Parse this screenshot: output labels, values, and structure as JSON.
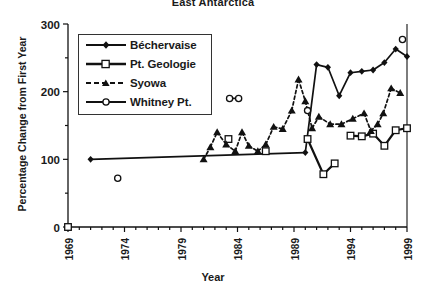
{
  "chart_data": {
    "type": "line",
    "title": "East Antarctica",
    "xlabel": "Year",
    "ylabel": "Percentage Change from First Year",
    "xlim": [
      1969,
      1999
    ],
    "ylim": [
      0,
      300
    ],
    "xticks": [
      1969,
      1974,
      1979,
      1984,
      1989,
      1994,
      1999
    ],
    "yticks": [
      0,
      100,
      200,
      300
    ],
    "xminor_step": 1,
    "yminor_step": 50,
    "grid": false,
    "legend_position": "upper-left",
    "series": [
      {
        "name": "Béchervaise",
        "marker": "filled-diamond",
        "line": "solid",
        "points": [
          {
            "x": 1971.0,
            "y": 100,
            "connected": false
          },
          {
            "x": 1990.0,
            "y": 110
          },
          {
            "x": 1991.0,
            "y": 240
          },
          {
            "x": 1992.0,
            "y": 236
          },
          {
            "x": 1993.0,
            "y": 194
          },
          {
            "x": 1994.0,
            "y": 228
          },
          {
            "x": 1995.0,
            "y": 230
          },
          {
            "x": 1996.0,
            "y": 232
          },
          {
            "x": 1997.0,
            "y": 243
          },
          {
            "x": 1998.0,
            "y": 263
          },
          {
            "x": 1999.0,
            "y": 252
          }
        ]
      },
      {
        "name": "Pt.  Geologie",
        "marker": "open-square",
        "line": "solid",
        "points": [
          {
            "x": 1969.0,
            "y": 0,
            "connected": false
          },
          {
            "x": 1983.2,
            "y": 130,
            "connected": false
          },
          {
            "x": 1986.5,
            "y": 112,
            "connected": false
          },
          {
            "x": 1990.2,
            "y": 130,
            "connected": false
          },
          {
            "x": 1991.6,
            "y": 78
          },
          {
            "x": 1992.6,
            "y": 94
          },
          {
            "x": 1994.0,
            "y": 135,
            "connected": false
          },
          {
            "x": 1995.0,
            "y": 134
          },
          {
            "x": 1996.0,
            "y": 138
          },
          {
            "x": 1997.0,
            "y": 120
          },
          {
            "x": 1998.0,
            "y": 143
          },
          {
            "x": 1999.0,
            "y": 146
          }
        ]
      },
      {
        "name": "Syowa",
        "marker": "filled-triangle",
        "line": "dashed",
        "points": [
          {
            "x": 1981.0,
            "y": 100
          },
          {
            "x": 1981.6,
            "y": 118
          },
          {
            "x": 1982.2,
            "y": 140
          },
          {
            "x": 1983.0,
            "y": 122
          },
          {
            "x": 1983.8,
            "y": 112
          },
          {
            "x": 1984.4,
            "y": 140
          },
          {
            "x": 1985.0,
            "y": 120
          },
          {
            "x": 1985.8,
            "y": 112
          },
          {
            "x": 1986.5,
            "y": 122
          },
          {
            "x": 1987.2,
            "y": 148
          },
          {
            "x": 1988.0,
            "y": 145
          },
          {
            "x": 1988.8,
            "y": 172
          },
          {
            "x": 1989.4,
            "y": 218
          },
          {
            "x": 1990.0,
            "y": 186
          },
          {
            "x": 1990.6,
            "y": 146
          },
          {
            "x": 1991.2,
            "y": 163
          },
          {
            "x": 1992.2,
            "y": 152
          },
          {
            "x": 1993.2,
            "y": 152
          },
          {
            "x": 1994.2,
            "y": 160
          },
          {
            "x": 1995.2,
            "y": 168
          },
          {
            "x": 1995.8,
            "y": 142
          },
          {
            "x": 1996.4,
            "y": 152
          },
          {
            "x": 1996.9,
            "y": 168
          },
          {
            "x": 1997.6,
            "y": 205
          },
          {
            "x": 1998.4,
            "y": 198
          }
        ]
      },
      {
        "name": "Whitney Pt.",
        "marker": "open-circle",
        "line": "solid",
        "points": [
          {
            "x": 1973.4,
            "y": 72,
            "connected": false
          },
          {
            "x": 1983.3,
            "y": 190,
            "connected": false
          },
          {
            "x": 1984.1,
            "y": 190
          },
          {
            "x": 1990.2,
            "y": 172,
            "connected": false
          },
          {
            "x": 1998.6,
            "y": 277,
            "connected": false
          }
        ]
      }
    ]
  },
  "legend": {
    "items": [
      {
        "label": "Béchervaise"
      },
      {
        "label": "Pt.  Geologie"
      },
      {
        "label": "Syowa"
      },
      {
        "label": "Whitney Pt."
      }
    ]
  }
}
